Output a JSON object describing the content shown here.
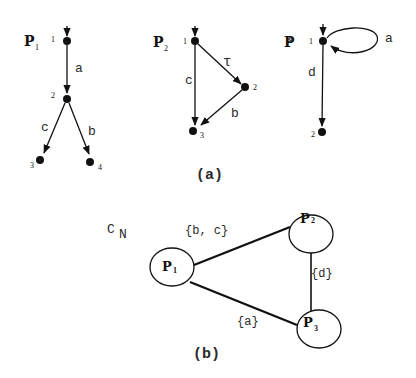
{
  "part_a": {
    "caption": "(a)",
    "processes": [
      {
        "name": "P",
        "subscript": "1",
        "states": [
          {
            "id": "1"
          },
          {
            "id": "2"
          },
          {
            "id": "3"
          },
          {
            "id": "4"
          }
        ],
        "transitions": [
          {
            "from": "1",
            "to": "2",
            "label": "a"
          },
          {
            "from": "2",
            "to": "3",
            "label": "c"
          },
          {
            "from": "2",
            "to": "4",
            "label": "b"
          }
        ]
      },
      {
        "name": "P",
        "subscript": "2",
        "states": [
          {
            "id": "1"
          },
          {
            "id": "2"
          },
          {
            "id": "3"
          }
        ],
        "transitions": [
          {
            "from": "1",
            "to": "2",
            "label": "τ"
          },
          {
            "from": "1",
            "to": "3",
            "label": "c"
          },
          {
            "from": "2",
            "to": "3",
            "label": "b"
          }
        ]
      },
      {
        "name": "P",
        "subscript": "3",
        "states": [
          {
            "id": "1"
          },
          {
            "id": "2"
          }
        ],
        "transitions": [
          {
            "from": "1",
            "to": "1",
            "label": "a"
          },
          {
            "from": "1",
            "to": "2",
            "label": "d"
          }
        ]
      }
    ]
  },
  "part_b": {
    "caption": "(b)",
    "network_label": "C",
    "network_subscript": "N",
    "nodes": [
      {
        "name": "P",
        "subscript": "1"
      },
      {
        "name": "P",
        "subscript": "2"
      },
      {
        "name": "P",
        "subscript": "3"
      }
    ],
    "links": [
      {
        "between": [
          "P1",
          "P2"
        ],
        "label": "{b, c}"
      },
      {
        "between": [
          "P2",
          "P3"
        ],
        "label": "{d}"
      },
      {
        "between": [
          "P1",
          "P3"
        ],
        "label": "{a}"
      }
    ]
  }
}
